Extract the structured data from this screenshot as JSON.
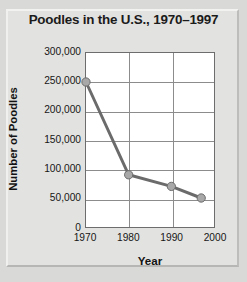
{
  "chart_data": {
    "type": "line",
    "title": "Poodles in the U.S., 1970–1997",
    "xlabel": "Year",
    "ylabel": "Number of Poodles",
    "x": [
      1970,
      1980,
      1990,
      1997
    ],
    "values": [
      250000,
      90000,
      70000,
      50000
    ],
    "point_labels": [
      "250,000",
      "90,000",
      "70,000",
      "50,000"
    ],
    "xlim": [
      1970,
      2000
    ],
    "ylim": [
      0,
      300000
    ],
    "xticks": [
      1970,
      1980,
      1990,
      2000
    ],
    "xtick_labels": [
      "1970",
      "1980",
      "1990",
      "2000"
    ],
    "yticks": [
      0,
      50000,
      100000,
      150000,
      200000,
      250000,
      300000
    ],
    "ytick_labels": [
      "0",
      "50,000",
      "100,000",
      "150,000",
      "200,000",
      "250,000",
      "300,000"
    ],
    "grid": true,
    "legend": false,
    "series_color": "#6b6b6b",
    "marker_color": "#a8a8a8",
    "marker_edge_color": "#6b6b6b",
    "plot_background": "#ffffff",
    "figure_background": "#d9d9d7",
    "grid_color": "#8c8c8c",
    "axis_color": "#6d6d6d"
  }
}
